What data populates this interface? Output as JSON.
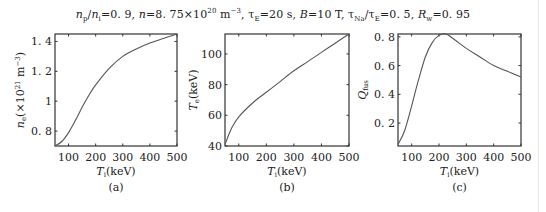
{
  "figure_title": "n_p/n_i=0.9, n=8.75×10^20 m^-3, τ_E=20 s, B=10 T, τ_Na/τ_E=0.5, R_w=0.95",
  "title_parts": {
    "p1": "/",
    "p2": "=0. 9, ",
    "p3": "=8. 75×10",
    "p3sup": "20",
    "p4": " m",
    "p4sup": "−3",
    "p5": ", τ",
    "p5sub": "E",
    "p6": "=20 s, ",
    "p7": "=10 T, τ",
    "p7sub": "Na",
    "p8": "/τ",
    "p8sub": "E",
    "p9": "=0. 5, ",
    "p10sub": "w",
    "p10": "=0. 95",
    "np": "n",
    "np_sub": "p",
    "ni": "n",
    "ni_sub": "i",
    "n": "n",
    "B": "B",
    "R": "R"
  },
  "chart_data": [
    {
      "type": "line",
      "panel_label": "(a)",
      "title": "",
      "xlabel": "T_i(keV)",
      "ylabel": "n_e(×10^21 m^-3)",
      "xlim": [
        50,
        500
      ],
      "ylim": [
        0.7,
        1.45
      ],
      "xticks": [
        100,
        200,
        300,
        400,
        500
      ],
      "yticks": [
        0.8,
        1,
        1.2,
        1.4
      ],
      "ytick_labels": [
        "0. 8",
        "1",
        "1. 2",
        "1. 4"
      ],
      "grid": false,
      "x": [
        50,
        75,
        100,
        125,
        150,
        175,
        200,
        250,
        300,
        350,
        400,
        450,
        500
      ],
      "y": [
        0.7,
        0.73,
        0.79,
        0.87,
        0.96,
        1.04,
        1.11,
        1.22,
        1.3,
        1.35,
        1.39,
        1.42,
        1.45
      ]
    },
    {
      "type": "line",
      "panel_label": "(b)",
      "title": "",
      "xlabel": "T_i(keV)",
      "ylabel": "T_e(keV)",
      "xlim": [
        50,
        500
      ],
      "ylim": [
        40,
        113
      ],
      "xticks": [
        100,
        200,
        300,
        400,
        500
      ],
      "yticks": [
        40,
        60,
        80,
        100
      ],
      "ytick_labels": [
        "40",
        "60",
        "80",
        "100"
      ],
      "grid": false,
      "x": [
        50,
        75,
        100,
        150,
        200,
        250,
        300,
        350,
        400,
        450,
        500
      ],
      "y": [
        41,
        52,
        59,
        68,
        75,
        82,
        89,
        95,
        101,
        107,
        113
      ]
    },
    {
      "type": "line",
      "panel_label": "(c)",
      "title": "",
      "xlabel": "T_i(keV)",
      "ylabel": "Q_fus",
      "xlim": [
        50,
        500
      ],
      "ylim": [
        0.04,
        0.82
      ],
      "xticks": [
        100,
        200,
        300,
        400,
        500
      ],
      "yticks": [
        0.2,
        0.4,
        0.6,
        0.8
      ],
      "ytick_labels": [
        "0. 2",
        "0. 4",
        "0. 6",
        "0. 8"
      ],
      "grid": false,
      "x": [
        50,
        75,
        100,
        125,
        150,
        175,
        200,
        225,
        250,
        300,
        350,
        400,
        450,
        500
      ],
      "y": [
        0.05,
        0.15,
        0.32,
        0.5,
        0.66,
        0.76,
        0.81,
        0.82,
        0.79,
        0.72,
        0.66,
        0.6,
        0.56,
        0.52
      ]
    }
  ],
  "panels": {
    "a": {
      "label": "(a)",
      "ylabel_main": "n",
      "ylabel_sub": "e",
      "ylabel_rest": "(×10",
      "ylabel_sup": "21",
      "ylabel_end": " m",
      "ylabel_sup2": "−3",
      "ylabel_close": ")",
      "xlabel_main": "T",
      "xlabel_sub": "i",
      "xlabel_rest": "(keV)"
    },
    "b": {
      "label": "(b)",
      "ylabel_main": "T",
      "ylabel_sub": "e",
      "ylabel_rest": "(keV)",
      "xlabel_main": "T",
      "xlabel_sub": "i",
      "xlabel_rest": "(keV)"
    },
    "c": {
      "label": "(c)",
      "ylabel_main": "Q",
      "ylabel_sub": "fus",
      "xlabel_main": "T",
      "xlabel_sub": "i",
      "xlabel_rest": "(keV)"
    }
  },
  "colors": {
    "axis": "#333333",
    "line": "#555555",
    "text": "#222222"
  }
}
